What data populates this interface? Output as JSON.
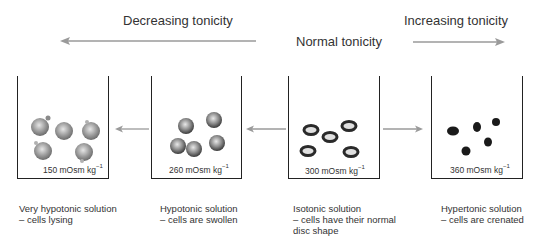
{
  "headers": {
    "decreasing": "Decreasing tonicity",
    "normal": "Normal tonicity",
    "increasing": "Increasing tonicity"
  },
  "beakers": [
    {
      "concentration": "150 mOsm kg",
      "unit_exp": "−1",
      "caption_line1": "Very hypotonic solution",
      "caption_line2": "– cells lysing",
      "caption_line3": "",
      "cell_state": "lysing"
    },
    {
      "concentration": "260 mOsm kg",
      "unit_exp": "−1",
      "caption_line1": "Hypotonic solution",
      "caption_line2": "– cells are swollen",
      "caption_line3": "",
      "cell_state": "swollen"
    },
    {
      "concentration": "300 mOsm kg",
      "unit_exp": "−1",
      "caption_line1": "Isotonic solution",
      "caption_line2": "– cells have their normal",
      "caption_line3": "disc shape",
      "cell_state": "normal-disc"
    },
    {
      "concentration": "360 mOsm kg",
      "unit_exp": "−1",
      "caption_line1": "Hypertonic solution",
      "caption_line2": "– cells are crenated",
      "caption_line3": "",
      "cell_state": "crenated"
    }
  ],
  "colors": {
    "arrow": "#9a9a9a",
    "beaker_outline": "#222222",
    "cell_grey": "#8f8f8f",
    "cell_dark": "#1a1a1a"
  }
}
